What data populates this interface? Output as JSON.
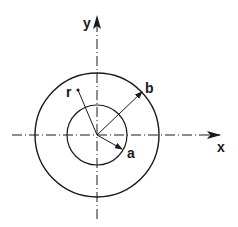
{
  "diagram": {
    "colors": {
      "stroke": "#1a1a1a",
      "background": "#ffffff"
    },
    "center": {
      "x": 97,
      "y": 135
    },
    "axes": {
      "x": {
        "label": "x",
        "from": 12,
        "to": 220,
        "label_x": 220,
        "label_y": 151
      },
      "y": {
        "label": "y",
        "from": 219,
        "to": 16,
        "label_x": 85,
        "label_y": 28
      }
    },
    "circles": [
      {
        "name": "outer",
        "radius": 62
      },
      {
        "name": "inner",
        "radius": 30
      }
    ],
    "labels": {
      "r": {
        "text": "r",
        "x": 66,
        "y": 97,
        "dot_x": 78,
        "dot_y": 90
      },
      "a": {
        "text": "a",
        "x": 127,
        "y": 157,
        "tip_x": 122,
        "tip_y": 149
      },
      "b": {
        "text": "b",
        "x": 145,
        "y": 93,
        "tip_x": 142,
        "tip_y": 92
      }
    }
  }
}
